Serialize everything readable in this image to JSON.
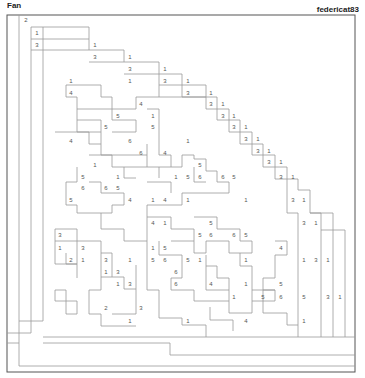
{
  "header": {
    "title": "Fan",
    "author": "federicat83"
  },
  "puzzle": {
    "grid": {
      "left": 7,
      "top": 15,
      "right": 355,
      "bottom": 372
    },
    "numbers": [
      {
        "x": 26,
        "y": 20,
        "v": "2"
      },
      {
        "x": 37,
        "y": 33,
        "v": "1"
      },
      {
        "x": 37,
        "y": 45,
        "v": "3"
      },
      {
        "x": 95,
        "y": 45,
        "v": "1"
      },
      {
        "x": 95,
        "y": 57,
        "v": "3"
      },
      {
        "x": 130,
        "y": 57,
        "v": "1"
      },
      {
        "x": 130,
        "y": 69,
        "v": "3"
      },
      {
        "x": 165,
        "y": 69,
        "v": "1"
      },
      {
        "x": 71,
        "y": 81,
        "v": "1"
      },
      {
        "x": 130,
        "y": 81,
        "v": "1"
      },
      {
        "x": 165,
        "y": 81,
        "v": "3"
      },
      {
        "x": 188,
        "y": 81,
        "v": "1"
      },
      {
        "x": 71,
        "y": 93,
        "v": "4"
      },
      {
        "x": 188,
        "y": 93,
        "v": "3"
      },
      {
        "x": 211,
        "y": 93,
        "v": "1"
      },
      {
        "x": 141,
        "y": 104,
        "v": "4"
      },
      {
        "x": 211,
        "y": 104,
        "v": "3"
      },
      {
        "x": 223,
        "y": 104,
        "v": "1"
      },
      {
        "x": 118,
        "y": 116,
        "v": "5"
      },
      {
        "x": 153,
        "y": 116,
        "v": "1"
      },
      {
        "x": 223,
        "y": 116,
        "v": "3"
      },
      {
        "x": 234,
        "y": 116,
        "v": "1"
      },
      {
        "x": 106,
        "y": 127,
        "v": "5"
      },
      {
        "x": 153,
        "y": 127,
        "v": "5"
      },
      {
        "x": 234,
        "y": 127,
        "v": "3"
      },
      {
        "x": 246,
        "y": 127,
        "v": "1"
      },
      {
        "x": 71,
        "y": 141,
        "v": "4"
      },
      {
        "x": 130,
        "y": 141,
        "v": "6"
      },
      {
        "x": 188,
        "y": 141,
        "v": "1"
      },
      {
        "x": 246,
        "y": 139,
        "v": "3"
      },
      {
        "x": 258,
        "y": 139,
        "v": "1"
      },
      {
        "x": 141,
        "y": 153,
        "v": "6"
      },
      {
        "x": 165,
        "y": 153,
        "v": "4"
      },
      {
        "x": 258,
        "y": 151,
        "v": "3"
      },
      {
        "x": 269,
        "y": 151,
        "v": "1"
      },
      {
        "x": 95,
        "y": 165,
        "v": "1"
      },
      {
        "x": 200,
        "y": 165,
        "v": "5"
      },
      {
        "x": 269,
        "y": 162,
        "v": "3"
      },
      {
        "x": 281,
        "y": 162,
        "v": "1"
      },
      {
        "x": 83,
        "y": 177,
        "v": "5"
      },
      {
        "x": 118,
        "y": 177,
        "v": "1"
      },
      {
        "x": 176,
        "y": 177,
        "v": "1"
      },
      {
        "x": 188,
        "y": 177,
        "v": "5"
      },
      {
        "x": 200,
        "y": 177,
        "v": "6"
      },
      {
        "x": 223,
        "y": 177,
        "v": "6"
      },
      {
        "x": 234,
        "y": 177,
        "v": "5"
      },
      {
        "x": 281,
        "y": 177,
        "v": "3"
      },
      {
        "x": 293,
        "y": 177,
        "v": "1"
      },
      {
        "x": 83,
        "y": 188,
        "v": "6"
      },
      {
        "x": 106,
        "y": 188,
        "v": "6"
      },
      {
        "x": 118,
        "y": 188,
        "v": "5"
      },
      {
        "x": 71,
        "y": 200,
        "v": "5"
      },
      {
        "x": 130,
        "y": 200,
        "v": "4"
      },
      {
        "x": 153,
        "y": 200,
        "v": "1"
      },
      {
        "x": 165,
        "y": 200,
        "v": "4"
      },
      {
        "x": 188,
        "y": 200,
        "v": "1"
      },
      {
        "x": 246,
        "y": 200,
        "v": "1"
      },
      {
        "x": 293,
        "y": 200,
        "v": "3"
      },
      {
        "x": 304,
        "y": 200,
        "v": "1"
      },
      {
        "x": 153,
        "y": 223,
        "v": "4"
      },
      {
        "x": 165,
        "y": 223,
        "v": "1"
      },
      {
        "x": 211,
        "y": 223,
        "v": "5"
      },
      {
        "x": 304,
        "y": 223,
        "v": "3"
      },
      {
        "x": 316,
        "y": 223,
        "v": "1"
      },
      {
        "x": 60,
        "y": 235,
        "v": "3"
      },
      {
        "x": 200,
        "y": 235,
        "v": "5"
      },
      {
        "x": 211,
        "y": 235,
        "v": "6"
      },
      {
        "x": 234,
        "y": 235,
        "v": "6"
      },
      {
        "x": 246,
        "y": 235,
        "v": "5"
      },
      {
        "x": 60,
        "y": 248,
        "v": "1"
      },
      {
        "x": 83,
        "y": 248,
        "v": "3"
      },
      {
        "x": 153,
        "y": 248,
        "v": "1"
      },
      {
        "x": 165,
        "y": 248,
        "v": "5"
      },
      {
        "x": 281,
        "y": 248,
        "v": "4"
      },
      {
        "x": 71,
        "y": 260,
        "v": "2"
      },
      {
        "x": 83,
        "y": 260,
        "v": "1"
      },
      {
        "x": 106,
        "y": 260,
        "v": "3"
      },
      {
        "x": 130,
        "y": 260,
        "v": "1"
      },
      {
        "x": 153,
        "y": 260,
        "v": "5"
      },
      {
        "x": 165,
        "y": 260,
        "v": "6"
      },
      {
        "x": 188,
        "y": 260,
        "v": "5"
      },
      {
        "x": 200,
        "y": 260,
        "v": "1"
      },
      {
        "x": 246,
        "y": 260,
        "v": "1"
      },
      {
        "x": 304,
        "y": 260,
        "v": "1"
      },
      {
        "x": 316,
        "y": 260,
        "v": "3"
      },
      {
        "x": 328,
        "y": 260,
        "v": "1"
      },
      {
        "x": 106,
        "y": 272,
        "v": "1"
      },
      {
        "x": 118,
        "y": 272,
        "v": "3"
      },
      {
        "x": 176,
        "y": 272,
        "v": "6"
      },
      {
        "x": 118,
        "y": 284,
        "v": "1"
      },
      {
        "x": 130,
        "y": 284,
        "v": "3"
      },
      {
        "x": 176,
        "y": 284,
        "v": "6"
      },
      {
        "x": 211,
        "y": 284,
        "v": "4"
      },
      {
        "x": 246,
        "y": 284,
        "v": "1"
      },
      {
        "x": 281,
        "y": 284,
        "v": "5"
      },
      {
        "x": 234,
        "y": 297,
        "v": "1"
      },
      {
        "x": 263,
        "y": 297,
        "v": "5"
      },
      {
        "x": 281,
        "y": 297,
        "v": "6"
      },
      {
        "x": 304,
        "y": 297,
        "v": "5"
      },
      {
        "x": 328,
        "y": 297,
        "v": "3"
      },
      {
        "x": 340,
        "y": 297,
        "v": "1"
      },
      {
        "x": 106,
        "y": 308,
        "v": "2"
      },
      {
        "x": 141,
        "y": 308,
        "v": "3"
      },
      {
        "x": 188,
        "y": 321,
        "v": "1"
      },
      {
        "x": 130,
        "y": 321,
        "v": "1"
      },
      {
        "x": 246,
        "y": 321,
        "v": "4"
      },
      {
        "x": 304,
        "y": 321,
        "v": "1"
      }
    ]
  }
}
